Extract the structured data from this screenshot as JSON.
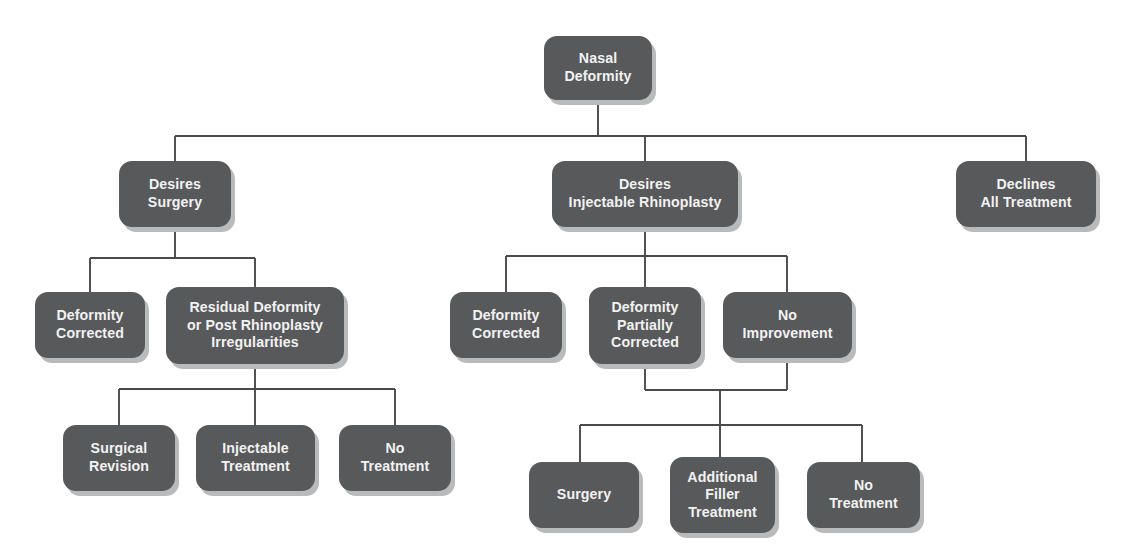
{
  "diagram": {
    "type": "flowchart",
    "orientation": "top-down",
    "canvas": {
      "width": 1121,
      "height": 549
    },
    "style": {
      "node_fill": "#58595b",
      "node_text_color": "#f2f2f2",
      "node_shadow": "#b9babb",
      "connector_color": "#4a4a4c",
      "background": "#ffffff",
      "node_corner_radius": 13
    },
    "nodes": [
      {
        "id": "nasal-deformity",
        "label": "Nasal Deformity",
        "lines": [
          "Nasal",
          "Deformity"
        ],
        "x": 544,
        "y": 36,
        "w": 108,
        "h": 64,
        "level": 0
      },
      {
        "id": "desires-surgery",
        "label": "Desires Surgery",
        "lines": [
          "Desires",
          "Surgery"
        ],
        "x": 119,
        "y": 161,
        "w": 112,
        "h": 66,
        "level": 1
      },
      {
        "id": "desires-injectable-rhinoplasty",
        "label": "Desires Injectable Rhinoplasty",
        "lines": [
          "Desires",
          "Injectable Rhinoplasty"
        ],
        "x": 552,
        "y": 161,
        "w": 186,
        "h": 66,
        "level": 1
      },
      {
        "id": "declines-all-treatment",
        "label": "Declines All Treatment",
        "lines": [
          "Declines",
          "All Treatment"
        ],
        "x": 956,
        "y": 161,
        "w": 140,
        "h": 66,
        "level": 1
      },
      {
        "id": "deformity-corrected-surgery",
        "label": "Deformity Corrected",
        "lines": [
          "Deformity",
          "Corrected"
        ],
        "x": 35,
        "y": 292,
        "w": 110,
        "h": 66,
        "level": 2
      },
      {
        "id": "residual-deformity",
        "label": "Residual Deformity or Post Rhinoplasty Irregularities",
        "lines": [
          "Residual Deformity",
          "or Post Rhinoplasty",
          "Irregularities"
        ],
        "x": 166,
        "y": 287,
        "w": 178,
        "h": 77,
        "level": 2
      },
      {
        "id": "deformity-corrected-injectable",
        "label": "Deformity Corrected",
        "lines": [
          "Deformity",
          "Corrected"
        ],
        "x": 450,
        "y": 292,
        "w": 112,
        "h": 66,
        "level": 2
      },
      {
        "id": "deformity-partially-corrected",
        "label": "Deformity Partially Corrected",
        "lines": [
          "Deformity",
          "Partially",
          "Corrected"
        ],
        "x": 589,
        "y": 287,
        "w": 112,
        "h": 77,
        "level": 2
      },
      {
        "id": "no-improvement",
        "label": "No Improvement",
        "lines": [
          "No",
          "Improvement"
        ],
        "x": 723,
        "y": 292,
        "w": 129,
        "h": 66,
        "level": 2
      },
      {
        "id": "surgical-revision",
        "label": "Surgical Revision",
        "lines": [
          "Surgical",
          "Revision"
        ],
        "x": 63,
        "y": 425,
        "w": 112,
        "h": 66,
        "level": 3
      },
      {
        "id": "injectable-treatment",
        "label": "Injectable Treatment",
        "lines": [
          "Injectable",
          "Treatment"
        ],
        "x": 196,
        "y": 425,
        "w": 119,
        "h": 66,
        "level": 3
      },
      {
        "id": "no-treatment-left",
        "label": "No Treatment",
        "lines": [
          "No",
          "Treatment"
        ],
        "x": 339,
        "y": 425,
        "w": 112,
        "h": 66,
        "level": 3
      },
      {
        "id": "surgery",
        "label": "Surgery",
        "lines": [
          "Surgery"
        ],
        "x": 529,
        "y": 462,
        "w": 110,
        "h": 66,
        "level": 4
      },
      {
        "id": "additional-filler-treatment",
        "label": "Additional Filler Treatment",
        "lines": [
          "Additional",
          "Filler",
          "Treatment"
        ],
        "x": 670,
        "y": 457,
        "w": 105,
        "h": 76,
        "level": 4
      },
      {
        "id": "no-treatment-right",
        "label": "No Treatment",
        "lines": [
          "No",
          "Treatment"
        ],
        "x": 807,
        "y": 462,
        "w": 113,
        "h": 66,
        "level": 4
      }
    ],
    "connectors": [
      {
        "id": "root-to-level1",
        "from": "nasal-deformity",
        "to": [
          "desires-surgery",
          "desires-injectable-rhinoplasty",
          "declines-all-treatment"
        ],
        "path": "M598,100 L598,136 M175,136 L1026,136 M175,136 L175,161 M645,136 L645,161 M1026,136 L1026,161"
      },
      {
        "id": "surgery-branch",
        "from": "desires-surgery",
        "to": [
          "deformity-corrected-surgery",
          "residual-deformity"
        ],
        "path": "M175,227 L175,258 M90,258 L255,258 M90,258 L90,292 M255,258 L255,287"
      },
      {
        "id": "injectable-branch",
        "from": "desires-injectable-rhinoplasty",
        "to": [
          "deformity-corrected-injectable",
          "deformity-partially-corrected",
          "no-improvement"
        ],
        "path": "M645,227 L645,256 M506,256 L787,256 M506,256 L506,292 M645,256 L645,287 M787,256 L787,292"
      },
      {
        "id": "residual-branch",
        "from": "residual-deformity",
        "to": [
          "surgical-revision",
          "injectable-treatment",
          "no-treatment-left"
        ],
        "path": "M255,364 L255,389 M119,389 L395,389 M119,389 L119,425 M255,389 L255,425 M395,389 L395,425"
      },
      {
        "id": "merge-to-outcomes",
        "from": [
          "deformity-partially-corrected",
          "no-improvement"
        ],
        "to": "outcome-bus",
        "path": "M645,364 L645,390 M787,358 L787,390 M645,390 L787,390 M720,390 L720,425"
      },
      {
        "id": "outcomes-branch",
        "from": "outcome-bus",
        "to": [
          "surgery",
          "additional-filler-treatment",
          "no-treatment-right"
        ],
        "path": "M580,425 L862,425 M580,425 L580,462 M720,425 L720,457 M862,425 L862,462"
      }
    ]
  }
}
